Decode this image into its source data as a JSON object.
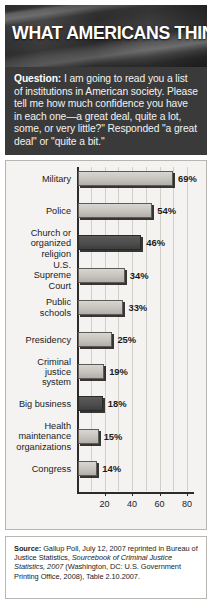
{
  "banner": {
    "title": "WHAT AMERICANS THINK",
    "image_name": "american-flag-photo"
  },
  "question": {
    "label": "Question:",
    "body": " I am going to read you a list of institutions in American society. Please tell me how much confidence you have in each one—a great deal, quite a lot, some, or very little?\" Responded \"a great deal\" or \"quite a bit.\""
  },
  "source": {
    "label": "Source:",
    "part1": " Gallup Poll, July 12, 2007 reprinted in Bureau of Justice Statistics, ",
    "italic1": "Sourcebook of Criminal Justice Statistics, 2007",
    "part2": " (Washington, DC: U.S. Government Printing Office, 2008), Table 2.10.2007."
  },
  "chart_data": {
    "type": "bar",
    "orientation": "horizontal",
    "title": "WHAT AMERICANS THINK",
    "xlabel": "",
    "ylabel": "",
    "xlim": [
      0,
      85
    ],
    "tick_values": [
      20,
      40,
      60,
      80
    ],
    "tick_labels": [
      "20",
      "40",
      "60",
      "80"
    ],
    "grid": true,
    "grid_axis": "x",
    "value_suffix": "%",
    "categories": [
      "Military",
      "Police",
      "Church or\norganized\nreligion",
      "U.S.\nSupreme\nCourt",
      "Public\nschools",
      "Presidency",
      "Criminal\njustice\nsystem",
      "Big business",
      "Health\nmaintenance\norganizations",
      "Congress"
    ],
    "values": [
      69,
      54,
      46,
      34,
      33,
      25,
      19,
      18,
      15,
      14
    ],
    "value_labels": [
      "69%",
      "54%",
      "46%",
      "34%",
      "33%",
      "25%",
      "19%",
      "18%",
      "15%",
      "14%"
    ],
    "bar_shades": [
      "light",
      "light",
      "dark",
      "light",
      "light",
      "light",
      "light",
      "dark",
      "light",
      "light"
    ],
    "colors": {
      "bar_light": "#c6c3be",
      "bar_dark": "#4e4e4e",
      "axis": "#2b2b2b",
      "grid": "#d2cfc9",
      "panel_background": "#f4f3f1",
      "banner_background": "#3a3a3a"
    }
  }
}
